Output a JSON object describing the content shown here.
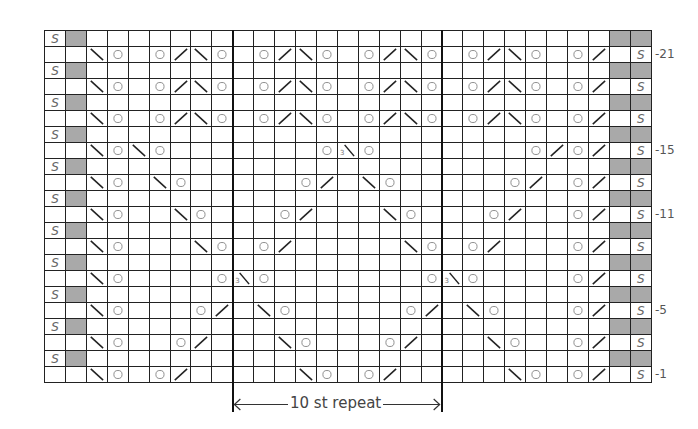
{
  "chart": {
    "cols": 29,
    "rows": 22,
    "cell_w": 20.93,
    "cell_h": 16.0,
    "gray_color": "#a9a9a9",
    "repeat_start_col": 10,
    "repeat_end_col": 19,
    "repeat_label": "10 st repeat",
    "row_labels": [
      {
        "row": 21,
        "text": "-21"
      },
      {
        "row": 15,
        "text": "-15"
      },
      {
        "row": 11,
        "text": "-11"
      },
      {
        "row": 5,
        "text": "-5"
      },
      {
        "row": 1,
        "text": "-1"
      }
    ],
    "legend_symbols": {
      "O": "yarn-over",
      "/": "k2tog",
      "\\": "ssk",
      "3\\": "double-decrease",
      "S": "slip-stitch",
      "G": "gray-no-stitch"
    },
    "odd_rows": {
      "21": {
        "3": "\\",
        "4": "O",
        "6": "O",
        "7": "/",
        "8": "\\",
        "9": "O",
        "11": "O",
        "12": "/",
        "13": "\\",
        "14": "O",
        "16": "O",
        "17": "/",
        "18": "\\",
        "19": "O",
        "21": "O",
        "22": "/",
        "23": "\\",
        "24": "O",
        "26": "O",
        "27": "/"
      },
      "19": {
        "3": "\\",
        "4": "O",
        "6": "O",
        "7": "/",
        "8": "\\",
        "9": "O",
        "11": "O",
        "12": "/",
        "13": "\\",
        "14": "O",
        "16": "O",
        "17": "/",
        "18": "\\",
        "19": "O",
        "21": "O",
        "22": "/",
        "23": "\\",
        "24": "O",
        "26": "O",
        "27": "/"
      },
      "17": {
        "3": "\\",
        "4": "O",
        "6": "O",
        "7": "/",
        "8": "\\",
        "9": "O",
        "11": "O",
        "12": "/",
        "13": "\\",
        "14": "O",
        "16": "O",
        "17": "/",
        "18": "\\",
        "19": "O",
        "21": "O",
        "22": "/",
        "23": "\\",
        "24": "O",
        "26": "O",
        "27": "/"
      },
      "15": {
        "3": "\\",
        "4": "O",
        "5": "\\",
        "6": "O",
        "14": "O",
        "15": "3\\",
        "16": "O",
        "24": "O",
        "25": "/",
        "26": "O",
        "27": "/"
      },
      "13": {
        "3": "\\",
        "4": "O",
        "6": "\\",
        "7": "O",
        "13": "O",
        "14": "/",
        "16": "\\",
        "17": "O",
        "23": "O",
        "24": "/",
        "26": "O",
        "27": "/"
      },
      "11": {
        "3": "\\",
        "4": "O",
        "7": "\\",
        "8": "O",
        "12": "O",
        "13": "/",
        "17": "\\",
        "18": "O",
        "22": "O",
        "23": "/",
        "26": "O",
        "27": "/"
      },
      "9": {
        "3": "\\",
        "4": "O",
        "8": "\\",
        "9": "O",
        "11": "O",
        "12": "/",
        "18": "\\",
        "19": "O",
        "21": "O",
        "22": "/",
        "26": "O",
        "27": "/"
      },
      "7": {
        "3": "\\",
        "4": "O",
        "9": "O",
        "10": "3\\",
        "11": "O",
        "19": "O",
        "20": "3\\",
        "21": "O",
        "26": "O",
        "27": "/"
      },
      "5": {
        "3": "\\",
        "4": "O",
        "8": "O",
        "9": "/",
        "11": "\\",
        "12": "O",
        "18": "O",
        "19": "/",
        "21": "\\",
        "22": "O",
        "26": "O",
        "27": "/"
      },
      "3": {
        "3": "\\",
        "4": "O",
        "7": "O",
        "8": "/",
        "12": "\\",
        "13": "O",
        "17": "O",
        "18": "/",
        "22": "\\",
        "23": "O",
        "26": "O",
        "27": "/"
      },
      "1": {
        "3": "\\",
        "4": "O",
        "6": "O",
        "7": "/",
        "13": "\\",
        "14": "O",
        "16": "O",
        "17": "/",
        "23": "\\",
        "24": "O",
        "26": "O",
        "27": "/"
      }
    },
    "even_row_pattern": {
      "1": "S",
      "2": "G",
      "28": "G",
      "29": "G"
    },
    "odd_row_edges": {
      "29": "S"
    },
    "slip_glyph": "S",
    "double_dec_digit": "3"
  }
}
